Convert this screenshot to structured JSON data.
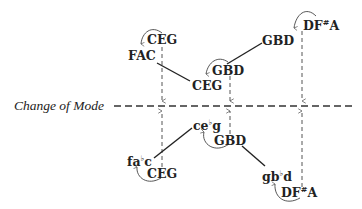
{
  "diagram": {
    "title": "Change of Mode",
    "axis_label": "Change of Mode",
    "upper_nodes": [
      {
        "id": "u_ceg_left",
        "label": "CEG"
      },
      {
        "id": "u_fac",
        "label": "FAC"
      },
      {
        "id": "u_ceg_center",
        "label": "CEG"
      },
      {
        "id": "u_gbd_mid",
        "label": "GBD"
      },
      {
        "id": "u_gbd_top",
        "label": "GBD"
      },
      {
        "id": "u_dfsa",
        "label_main": "DF",
        "accidental": "#",
        "label_end": "A"
      }
    ],
    "lower_nodes": [
      {
        "id": "l_faflatc",
        "label_main": "fa",
        "accidental": "♭",
        "label_end": "c"
      },
      {
        "id": "l_ceg",
        "label": "CEG"
      },
      {
        "id": "l_ceflatg",
        "label_main": "ce",
        "accidental": "♭",
        "label_end": "g"
      },
      {
        "id": "l_gbd",
        "label": "GBD"
      },
      {
        "id": "l_gbflatd",
        "label_main": "gb",
        "accidental": "♭",
        "label_end": "d"
      },
      {
        "id": "l_dfsa",
        "label_main": "DF",
        "accidental": "#",
        "label_end": "A"
      }
    ],
    "edges_solid": [
      {
        "from": "FAC",
        "to": "CEG (center)"
      },
      {
        "from": "GBD (mid)",
        "to": "GBD (top)"
      },
      {
        "from": "fa♭c",
        "to": "ce♭g"
      },
      {
        "from": "GBD (lower)",
        "to": "gb♭d"
      }
    ],
    "curved_arrows": [
      {
        "from": "CEG",
        "to": "FAC"
      },
      {
        "from": "GBD",
        "to": "CEG"
      },
      {
        "from": "DF#A",
        "to": "GBD"
      },
      {
        "from": "CEG",
        "to": "fa♭c"
      },
      {
        "from": "GBD",
        "to": "ce♭g"
      },
      {
        "from": "DF#A",
        "to": "gb♭d"
      }
    ],
    "dashed_arrows": [
      {
        "from": "CEG (upper)",
        "to": "Change of Mode"
      },
      {
        "from": "GBD (upper)",
        "to": "Change of Mode"
      },
      {
        "from": "DF#A (upper)",
        "to": "Change of Mode"
      },
      {
        "from": "CEG (lower)",
        "to": "Change of Mode"
      },
      {
        "from": "GBD (lower)",
        "to": "Change of Mode"
      },
      {
        "from": "DF#A (lower)",
        "to": "Change of Mode"
      }
    ]
  }
}
